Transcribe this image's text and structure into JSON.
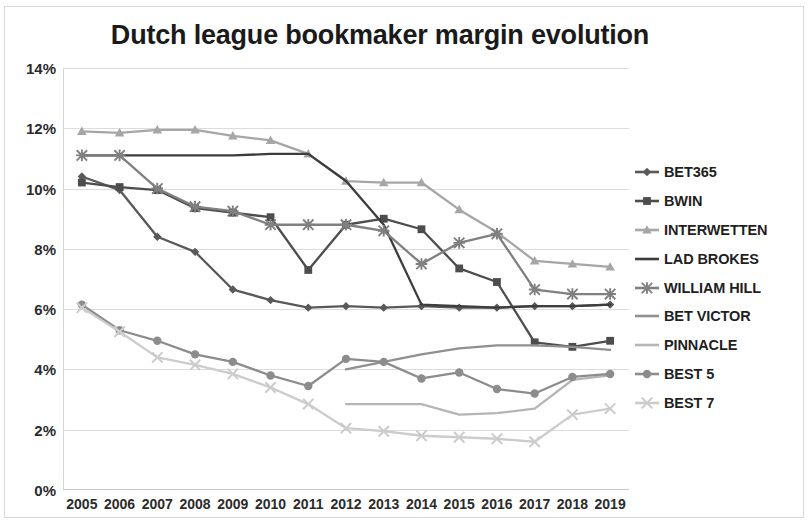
{
  "chart_data": {
    "type": "line",
    "title": "Dutch league bookmaker margin evolution",
    "xlabel": "",
    "ylabel": "",
    "grid": true,
    "legend_position": "right",
    "categories": [
      "2005",
      "2006",
      "2007",
      "2008",
      "2009",
      "2010",
      "2011",
      "2012",
      "2013",
      "2014",
      "2015",
      "2016",
      "2017",
      "2018",
      "2019"
    ],
    "ytick_labels": [
      "14%",
      "12%",
      "10%",
      "8%",
      "6%",
      "4%",
      "2%",
      "0%"
    ],
    "ytick_values": [
      14,
      12,
      10,
      8,
      6,
      4,
      2,
      0
    ],
    "ylim": [
      0,
      14
    ],
    "yunit": "%",
    "series": [
      {
        "name": "BET365",
        "marker": "diamond",
        "color": "#595959",
        "values": [
          10.4,
          9.95,
          8.4,
          7.9,
          6.65,
          6.3,
          6.05,
          6.1,
          6.05,
          6.1,
          6.05,
          6.05,
          6.1,
          6.1,
          6.15
        ]
      },
      {
        "name": "BWIN",
        "marker": "square",
        "color": "#4d4d4d",
        "values": [
          10.2,
          10.05,
          9.95,
          9.35,
          9.2,
          9.05,
          7.3,
          8.8,
          9.0,
          8.65,
          7.35,
          6.9,
          4.9,
          4.75,
          4.95
        ]
      },
      {
        "name": "INTERWETTEN",
        "marker": "triangle",
        "color": "#a6a6a6",
        "values": [
          11.9,
          11.85,
          11.95,
          11.95,
          11.75,
          11.6,
          11.15,
          10.25,
          10.2,
          10.2,
          9.3,
          8.55,
          7.6,
          7.5,
          7.4
        ]
      },
      {
        "name": "LAD BROKES",
        "marker": "none",
        "color": "#3d3d3d",
        "values": [
          11.1,
          11.1,
          11.1,
          11.1,
          11.1,
          11.15,
          11.15,
          10.25,
          8.8,
          6.15,
          6.1,
          6.05,
          6.1,
          6.1,
          6.15
        ]
      },
      {
        "name": "WILLIAM HILL",
        "marker": "asterisk",
        "color": "#808080",
        "values": [
          11.1,
          11.1,
          10.0,
          9.4,
          9.25,
          8.8,
          8.8,
          8.8,
          8.6,
          7.5,
          8.2,
          8.5,
          6.65,
          6.5,
          6.5
        ]
      },
      {
        "name": "BET VICTOR",
        "marker": "none",
        "color": "#909090",
        "values": [
          null,
          null,
          null,
          null,
          null,
          null,
          null,
          4.0,
          4.25,
          4.5,
          4.7,
          4.8,
          4.8,
          4.75,
          4.65
        ]
      },
      {
        "name": "PINNACLE",
        "marker": "none",
        "color": "#b5b5b5",
        "values": [
          null,
          null,
          null,
          null,
          null,
          null,
          null,
          2.85,
          2.85,
          2.85,
          2.5,
          2.55,
          2.7,
          3.65,
          3.8
        ]
      },
      {
        "name": "BEST 5",
        "marker": "circle",
        "color": "#8c8c8c",
        "values": [
          6.15,
          5.3,
          4.95,
          4.5,
          4.25,
          3.8,
          3.45,
          4.35,
          4.25,
          3.7,
          3.9,
          3.35,
          3.2,
          3.75,
          3.85
        ]
      },
      {
        "name": "BEST 7",
        "marker": "cross",
        "color": "#cccccc",
        "values": [
          6.05,
          5.25,
          4.4,
          4.15,
          3.85,
          3.4,
          2.85,
          2.05,
          1.95,
          1.8,
          1.75,
          1.7,
          1.6,
          2.5,
          2.7
        ]
      }
    ]
  }
}
